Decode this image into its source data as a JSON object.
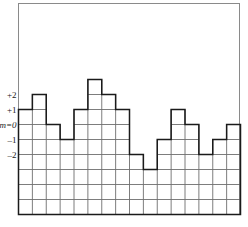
{
  "figure": {
    "name": "step-histogram-figure",
    "background_color": "#ffffff",
    "frame_color": "#8a8a8a",
    "grid_color": "#6e6e6e",
    "step_color": "#1a1a1a"
  },
  "axis": {
    "y_tick_labels": [
      {
        "id": "tick-plus-2",
        "text": "+2",
        "value": 2,
        "italic": false
      },
      {
        "id": "tick-plus-1",
        "text": "+1",
        "value": 1,
        "italic": false
      },
      {
        "id": "tick-m-zero",
        "text": "m=0",
        "value": 0,
        "italic": true
      },
      {
        "id": "tick-minus-1",
        "text": "–1",
        "value": -1,
        "italic": false
      },
      {
        "id": "tick-minus-2",
        "text": "–2",
        "value": -2,
        "italic": false
      }
    ]
  },
  "chart_data": {
    "type": "bar",
    "title": "",
    "subtitle": "",
    "xlabel": "",
    "ylabel": "",
    "legend": [],
    "grid": true,
    "grid_columns": 16,
    "grid_rows": 10,
    "xlim": [
      0,
      16
    ],
    "ylim": [
      -6,
      4
    ],
    "categories": [
      "1",
      "2",
      "3",
      "4",
      "5",
      "6",
      "7",
      "8",
      "9",
      "10",
      "11",
      "12",
      "13",
      "14",
      "15",
      "16"
    ],
    "values": [
      1,
      2,
      0,
      -1,
      1,
      3,
      2,
      1,
      -2,
      -3,
      -1,
      1,
      0,
      -2,
      -1,
      0
    ],
    "baseline": -6,
    "annotations": []
  }
}
